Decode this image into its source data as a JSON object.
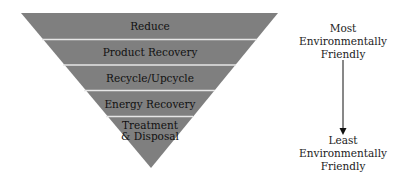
{
  "diagram": {
    "type": "inverted-pyramid",
    "fill_color": "#7f7f7f",
    "separator_color": "#e6e6e6",
    "tiers": [
      {
        "label": "Reduce"
      },
      {
        "label": "Product Recovery"
      },
      {
        "label": "Recycle/Upcycle"
      },
      {
        "label": "Energy Recovery"
      },
      {
        "label": "Treatment\n& Disposal",
        "line1": "Treatment",
        "line2": "& Disposal"
      }
    ],
    "scale": {
      "top": {
        "line1": "Most",
        "line2": "Environmentally",
        "line3": "Friendly"
      },
      "bottom": {
        "line1": "Least",
        "line2": "Environmentally",
        "line3": "Friendly"
      },
      "arrow_direction": "down"
    }
  }
}
